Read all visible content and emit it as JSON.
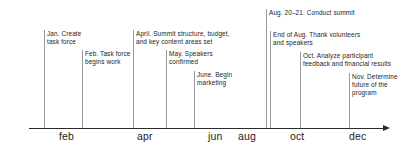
{
  "figure": {
    "kind": "timeline",
    "axis": {
      "arrow_direction": "right",
      "month_labels": [
        "feb",
        "apr",
        "jun",
        "aug",
        "oct",
        "dec"
      ]
    },
    "events": [
      {
        "id": "jan",
        "lines": [
          "Jan. Create",
          "task force"
        ]
      },
      {
        "id": "feb",
        "lines": [
          "Feb. Task force",
          "begins work"
        ]
      },
      {
        "id": "april",
        "lines": [
          "April. Summit structure, budget,",
          "and key content areas set"
        ]
      },
      {
        "id": "may",
        "lines": [
          "May. Speakers",
          "confirmed"
        ]
      },
      {
        "id": "june",
        "lines": [
          "June. Begin",
          "marketing"
        ]
      },
      {
        "id": "aug-summit",
        "lines": [
          "Aug. 20–21. Conduct summit"
        ]
      },
      {
        "id": "end-aug",
        "lines": [
          "End of Aug. Thank volunteers",
          "and speakers"
        ]
      },
      {
        "id": "oct",
        "lines": [
          "Oct. Analyze participant",
          "feedback and financial results"
        ]
      },
      {
        "id": "nov",
        "lines": [
          "Nov. Determine",
          "future of the",
          "program"
        ]
      }
    ],
    "colors": {
      "axis": "#2b2b2b",
      "leader": "#9a9a9a",
      "text": "#1c1c1c",
      "background": "#ffffff"
    }
  }
}
